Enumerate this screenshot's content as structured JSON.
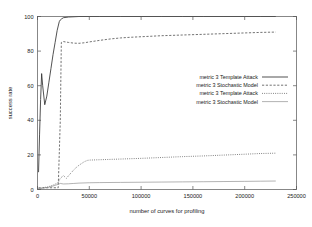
{
  "chart_data": {
    "type": "line",
    "title": "",
    "xlabel": "number of curves for profiling",
    "ylabel": "success rate",
    "xlim": [
      0,
      250000
    ],
    "ylim": [
      0,
      100
    ],
    "grid": false,
    "legend_position": "center-right",
    "xticks": [
      "0",
      "50000",
      "100000",
      "150000",
      "200000",
      "250000"
    ],
    "xtick_values": [
      0,
      50000,
      100000,
      150000,
      200000,
      250000
    ],
    "yticks": [
      "0",
      "20",
      "40",
      "60",
      "80",
      "100"
    ],
    "ytick_values": [
      0,
      20,
      40,
      60,
      80,
      100
    ],
    "series": [
      {
        "name": "metric 3 Template Attack",
        "style": "solid",
        "color": "#333333",
        "x": [
          1000,
          2000,
          3000,
          4000,
          5000,
          7000,
          9000,
          11000,
          13000,
          15000,
          17000,
          19000,
          21000,
          22000,
          23000,
          25000,
          30000,
          40000,
          50000,
          60000,
          80000,
          100000,
          120000,
          140000,
          160000,
          180000,
          200000,
          215000,
          230000
        ],
        "y": [
          10,
          32,
          52,
          67,
          60,
          49,
          54,
          62,
          70,
          78,
          85,
          92,
          97,
          98,
          98.5,
          99.3,
          99.7,
          100,
          100,
          100,
          100,
          100,
          100,
          100,
          100,
          100,
          100,
          100,
          100
        ]
      },
      {
        "name": "metric 3 Stochastic Model",
        "style": "dashed",
        "color": "#444444",
        "x": [
          1000,
          5000,
          10000,
          15000,
          20000,
          22000,
          23000,
          25000,
          30000,
          35000,
          40000,
          45000,
          50000,
          60000,
          70000,
          80000,
          90000,
          100000,
          120000,
          140000,
          160000,
          180000,
          200000,
          215000,
          230000
        ],
        "y": [
          1,
          1,
          1,
          1,
          1,
          40,
          85,
          85.5,
          85,
          84.6,
          84.5,
          84.8,
          85.3,
          86.2,
          87,
          87.6,
          88,
          88.3,
          88.9,
          89.3,
          89.7,
          90.1,
          90.5,
          90.8,
          91
        ],
        "note": "vertical jump at x~22000 from baseline to 85"
      },
      {
        "name": "metric 3 Template Attack",
        "style": "dotted",
        "color": "#555555",
        "x": [
          1000,
          5000,
          10000,
          15000,
          20000,
          22000,
          25000,
          28000,
          30000,
          33000,
          36000,
          40000,
          45000,
          48000,
          50000,
          60000,
          80000,
          100000,
          120000,
          140000,
          160000,
          180000,
          200000,
          215000,
          230000
        ],
        "y": [
          0.5,
          1,
          1.5,
          2.5,
          4,
          6.5,
          8,
          6.5,
          8,
          10,
          12,
          14,
          16,
          16.8,
          17,
          17.2,
          17.6,
          18,
          18.5,
          19,
          19.4,
          19.9,
          20.4,
          20.8,
          21
        ]
      },
      {
        "name": "metric 3 Stochastic Model",
        "style": "light-solid",
        "color": "#8a8a8a",
        "x": [
          1000,
          5000,
          10000,
          15000,
          20000,
          22000,
          25000,
          30000,
          35000,
          40000,
          50000,
          60000,
          80000,
          100000,
          120000,
          140000,
          160000,
          180000,
          200000,
          215000,
          230000
        ],
        "y": [
          0.3,
          0.8,
          1.2,
          2,
          3,
          3.5,
          3.2,
          3.3,
          3.5,
          3.7,
          3.9,
          4,
          4.1,
          4.2,
          4.3,
          4.4,
          4.5,
          4.6,
          4.7,
          4.8,
          4.9
        ]
      }
    ]
  },
  "legend": {
    "entries": [
      {
        "label": "metric 3 Template Attack",
        "style": "solid"
      },
      {
        "label": "metric 3 Stochastic Model",
        "style": "dashed"
      },
      {
        "label": "metric 3 Template Attack",
        "style": "dotted"
      },
      {
        "label": "metric 3 Stochastic Model",
        "style": "light-solid"
      }
    ]
  }
}
